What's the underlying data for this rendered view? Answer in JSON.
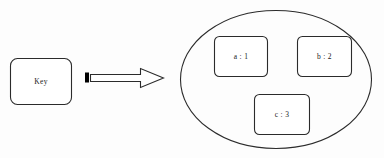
{
  "diagram": {
    "stroke_color": "#2b2b2b",
    "fill_color": "#ffffff",
    "accent_color": "#000000",
    "background_color": "#fdfdfd",
    "key_box": {
      "label": "Key",
      "shape": "rounded-rectangle"
    },
    "arrow": {
      "direction": "right",
      "style": "block-arrow-outline",
      "tail_marker": "filled-square"
    },
    "container": {
      "shape": "ellipse",
      "label": ""
    },
    "entries": [
      {
        "key": "a",
        "separator": ":",
        "value": "1",
        "label": "a : 1"
      },
      {
        "key": "b",
        "separator": ":",
        "value": "2",
        "label": "b : 2"
      },
      {
        "key": "c",
        "separator": ":",
        "value": "3",
        "label": "c : 3"
      }
    ]
  }
}
